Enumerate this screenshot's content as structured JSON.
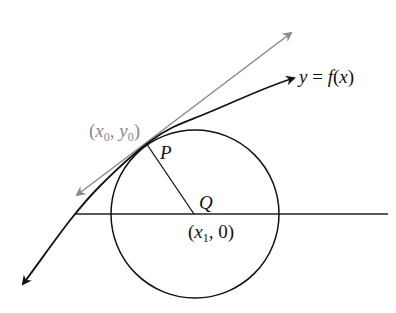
{
  "diagram": {
    "type": "geometry",
    "labels": {
      "curve": "y = f(x)",
      "curve_y": "y",
      "curve_eq": " = ",
      "curve_f": "f",
      "curve_open": "(",
      "curve_x": "x",
      "curve_close": ")",
      "point_p": "P",
      "point_q": "Q",
      "tangent_point": "(x0, y0)",
      "tp_open": "(",
      "tp_x": "x",
      "tp_x_sub": "0",
      "tp_comma": ", ",
      "tp_y": "y",
      "tp_y_sub": "0",
      "tp_close": ")",
      "center_point": "(x1, 0)",
      "cp_open": "(",
      "cp_x": "x",
      "cp_x_sub": "1",
      "cp_rest": ", 0)"
    },
    "colors": {
      "curve": "#111111",
      "tangent": "#8a8a8a",
      "circle": "#111111",
      "axis": "#222222",
      "tangent_label": "#8a8a8a"
    },
    "elements": [
      "circle",
      "curve y=f(x)",
      "tangent line at P",
      "radius PQ",
      "horizontal x-axis line"
    ]
  }
}
